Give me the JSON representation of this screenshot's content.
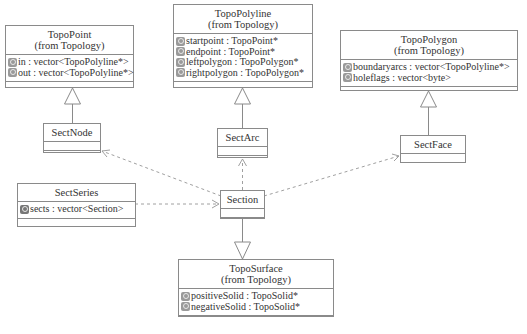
{
  "diagram": {
    "type": "UML class diagram",
    "classes": {
      "topo_point": {
        "name": "TopoPoint",
        "package": "(from Topology)",
        "attributes": [
          "in : vector<TopoPolyline*>",
          "out : vector<TopoPolyline*>"
        ]
      },
      "topo_polyline": {
        "name": "TopoPolyline",
        "package": "(from Topology)",
        "attributes": [
          "startpoint : TopoPoint*",
          "endpoint : TopoPoint*",
          "leftpolygon : TopoPolygon*",
          "rightpolygon : TopoPolygon*"
        ]
      },
      "topo_polygon": {
        "name": "TopoPolygon",
        "package": "(from Topology)",
        "attributes": [
          "boundaryarcs : vector<TopoPolyline*>",
          "holeflags : vector<byte>"
        ]
      },
      "sect_node": {
        "name": "SectNode"
      },
      "sect_arc": {
        "name": "SectArc"
      },
      "sect_face": {
        "name": "SectFace"
      },
      "sect_series": {
        "name": "SectSeries",
        "attributes": [
          "sects : vector<Section>"
        ]
      },
      "section": {
        "name": "Section"
      },
      "topo_surface": {
        "name": "TopoSurface",
        "package": "(from Topology)",
        "attributes": [
          "positiveSolid : TopoSolid*",
          "negativeSolid : TopoSolid*"
        ]
      }
    },
    "relations": [
      {
        "from": "SectNode",
        "to": "TopoPoint",
        "kind": "generalization"
      },
      {
        "from": "SectArc",
        "to": "TopoPolyline",
        "kind": "generalization"
      },
      {
        "from": "SectFace",
        "to": "TopoPolygon",
        "kind": "generalization"
      },
      {
        "from": "Section",
        "to": "TopoSurface",
        "kind": "generalization"
      },
      {
        "from": "Section",
        "to": "SectNode",
        "kind": "dependency"
      },
      {
        "from": "Section",
        "to": "SectArc",
        "kind": "dependency"
      },
      {
        "from": "Section",
        "to": "SectFace",
        "kind": "dependency"
      },
      {
        "from": "SectSeries",
        "to": "Section",
        "kind": "dependency"
      }
    ],
    "colors": {
      "line": "#8a8a8a",
      "dashed": "#9a9a9a",
      "text": "#333333",
      "icon": "#9a9a9a"
    }
  }
}
